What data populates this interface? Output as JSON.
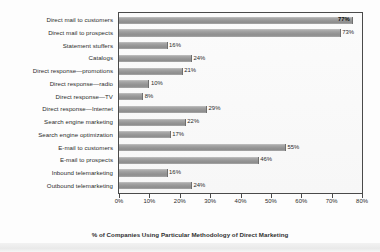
{
  "chart_data": {
    "type": "bar",
    "orientation": "horizontal",
    "title": "",
    "xlabel": "% of Companies Using Particular Methodology of Direct Marketing",
    "ylabel": "",
    "xlim": [
      0,
      80
    ],
    "xticks": [
      "0%",
      "10%",
      "20%",
      "30%",
      "40%",
      "50%",
      "60%",
      "70%",
      "80%"
    ],
    "xtick_values": [
      0,
      10,
      20,
      30,
      40,
      50,
      60,
      70,
      80
    ],
    "grid": false,
    "legend": false,
    "categories": [
      "Direct mail to customers",
      "Direct mail to prospects",
      "Statement stuffers",
      "Catalogs",
      "Direct response—promotions",
      "Direct response—radio",
      "Direct response—TV",
      "Direct response—Internet",
      "Search engine marketing",
      "Search engine optimization",
      "E-mail to customers",
      "E-mail to prospects",
      "Inbound telemarketing",
      "Outbound telemarketing"
    ],
    "values": [
      77,
      73,
      16,
      24,
      21,
      10,
      8,
      29,
      22,
      17,
      55,
      46,
      16,
      24
    ],
    "value_labels": [
      "77%",
      "73%",
      "16%",
      "24%",
      "21%",
      "10%",
      "8%",
      "29%",
      "22%",
      "17%",
      "55%",
      "46%",
      "16%",
      "24%"
    ],
    "label_placement": [
      "inside",
      "outside",
      "outside",
      "outside",
      "outside",
      "outside",
      "outside",
      "outside",
      "outside",
      "outside",
      "outside",
      "outside",
      "outside",
      "outside"
    ],
    "bar_color": "#9a9a9a",
    "frame_color": "#4a4a4a",
    "text_color": "#2b2b2b"
  }
}
